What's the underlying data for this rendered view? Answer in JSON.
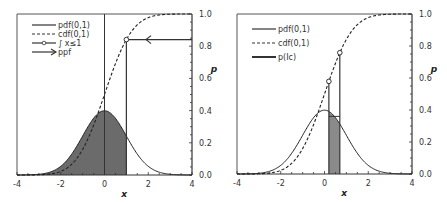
{
  "chart_data": [
    {
      "type": "line",
      "title": "",
      "xlabel": "x",
      "ylabel": "p",
      "xlim": [
        -4,
        4
      ],
      "ylim": [
        0.0,
        1.0
      ],
      "xticks": [
        "-4",
        "-2",
        "0",
        "2",
        "4"
      ],
      "yticks": [
        "0.0",
        "0.2",
        "0.4",
        "0.6",
        "0.8",
        "1.0"
      ],
      "y_axis_side": "right",
      "grid": false,
      "legend_position": "top-left",
      "series": [
        {
          "name": "pdf(0,1)",
          "kind": "normal-pdf",
          "mu": 0,
          "sigma": 1,
          "style": "solid"
        },
        {
          "name": "cdf(0,1)",
          "kind": "normal-cdf",
          "mu": 0,
          "sigma": 1,
          "style": "dashed"
        }
      ],
      "legend": [
        {
          "label": "pdf(0,1)",
          "marker": "solid-line"
        },
        {
          "label": "cdf(0,1)",
          "marker": "dashed-line"
        },
        {
          "label": "∫ x≤1",
          "marker": "line-with-circle"
        },
        {
          "label": "ppf",
          "marker": "arrow"
        }
      ],
      "shaded_region": {
        "from": -4,
        "to": 1,
        "under": "pdf(0,1)"
      },
      "vertical_lines": [
        0,
        1
      ],
      "points": [
        {
          "x": 1,
          "y": 0.841
        }
      ],
      "ppf_arrow": {
        "y": 0.841,
        "from_x": 4,
        "to_x": 1
      }
    },
    {
      "type": "line",
      "title": "",
      "xlabel": "x",
      "ylabel": "p",
      "xlim": [
        -4,
        4
      ],
      "ylim": [
        0.0,
        1.0
      ],
      "xticks": [
        "-4",
        "-2",
        "0",
        "2",
        "4"
      ],
      "yticks": [
        "0.0",
        "0.2",
        "0.4",
        "0.6",
        "0.8",
        "1.0"
      ],
      "y_axis_side": "right",
      "grid": false,
      "legend_position": "top-left",
      "series": [
        {
          "name": "pdf(0,1)",
          "kind": "normal-pdf",
          "mu": 0,
          "sigma": 1,
          "style": "solid"
        },
        {
          "name": "cdf(0,1)",
          "kind": "normal-cdf",
          "mu": 0,
          "sigma": 1,
          "style": "dashed"
        }
      ],
      "legend": [
        {
          "label": "pdf(0,1)",
          "marker": "solid-line"
        },
        {
          "label": "cdf(0,1)",
          "marker": "dashed-line"
        },
        {
          "label": "p(Ic)",
          "marker": "thick-line"
        }
      ],
      "shaded_region": {
        "from": 0.2,
        "to": 0.7,
        "under": "pdf(0,1)"
      },
      "points": [
        {
          "x": 0.2,
          "y": 0.579
        },
        {
          "x": 0.7,
          "y": 0.758
        }
      ],
      "rect_level": 0.36
    }
  ]
}
